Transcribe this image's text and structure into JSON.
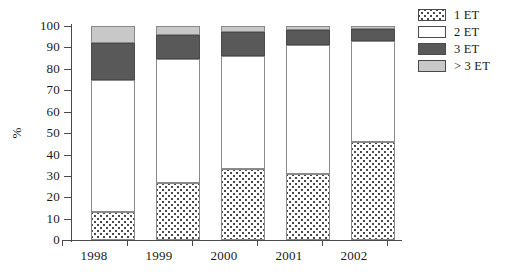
{
  "chart_data": {
    "type": "bar",
    "subtype": "stacked-bar-100",
    "title": "",
    "xlabel": "",
    "ylabel": "%",
    "ylim": [
      0,
      100
    ],
    "yticks": [
      0,
      10,
      20,
      30,
      40,
      50,
      60,
      70,
      80,
      90,
      100
    ],
    "ytick_labels": [
      "0",
      "10",
      "20",
      "30",
      "40",
      "50",
      "60",
      "70",
      "80",
      "90",
      "100"
    ],
    "grid": false,
    "legend_position": "top-right",
    "categories": [
      "1998",
      "1999",
      "2000",
      "2001",
      "2002"
    ],
    "series": [
      {
        "name": "1 ET",
        "values": [
          13.0,
          26.5,
          33.0,
          31.0,
          46.0
        ]
      },
      {
        "name": "2 ET",
        "values": [
          62.0,
          58.0,
          53.0,
          60.0,
          47.0
        ]
      },
      {
        "name": "3 ET",
        "values": [
          17.0,
          11.5,
          11.0,
          7.0,
          5.5
        ]
      },
      {
        "name": "> 3 ET",
        "values": [
          8.0,
          4.0,
          3.0,
          2.0,
          1.5
        ]
      }
    ],
    "cumulative_tops": {
      "1998": [
        13.0,
        75.0,
        92.0,
        100.0
      ],
      "1999": [
        26.5,
        84.5,
        96.0,
        100.0
      ],
      "2000": [
        33.0,
        86.0,
        97.0,
        100.0
      ],
      "2001": [
        31.0,
        91.0,
        98.0,
        100.0
      ],
      "2002": [
        46.0,
        93.0,
        98.5,
        100.0
      ]
    },
    "colors": {
      "1 ET": "#ffffff",
      "2 ET": "#ffffff",
      "3 ET": "#595959",
      "> 3 ET": "#c8c8c8",
      "axis": "#4a4a4a",
      "outline": "#8a8a8a"
    },
    "patterns": {
      "1 ET": "dotted",
      "2 ET": "solid",
      "3 ET": "solid",
      "> 3 ET": "solid"
    }
  },
  "axis": {
    "y_title": "%",
    "y_tick_labels": [
      "100",
      "90",
      "80",
      "70",
      "60",
      "50",
      "40",
      "30",
      "20",
      "10",
      "0"
    ],
    "x_tick_labels": [
      "1998",
      "1999",
      "2000",
      "2001",
      "2002"
    ]
  },
  "legend": {
    "items": [
      {
        "label": "1 ET",
        "swatch": "dotted-swatch"
      },
      {
        "label": "2 ET",
        "swatch": "white-swatch"
      },
      {
        "label": "3 ET",
        "swatch": "dark-gray-swatch"
      },
      {
        "label": "> 3 ET",
        "swatch": "light-gray-swatch"
      }
    ]
  }
}
